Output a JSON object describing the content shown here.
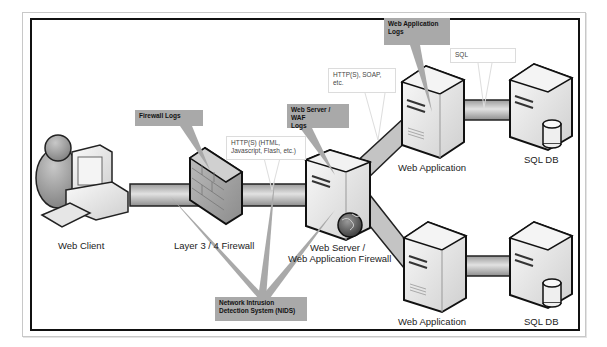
{
  "diagram": {
    "colors": {
      "frame": "#111111",
      "pipe": "#b5b5b5",
      "callout_dark": "#a9a9a9",
      "callout_light": "#ffffff"
    },
    "nodes": {
      "web_client": {
        "label": "Web Client",
        "icon": "user-computer-icon"
      },
      "firewall": {
        "label": "Layer 3 / 4 Firewall",
        "icon": "brick-firewall-icon"
      },
      "web_server": {
        "label_line1": "Web Server /",
        "label_line2": "Web Application Firewall",
        "icon": "server-globe-icon"
      },
      "web_app_top": {
        "label": "Web Application",
        "icon": "server-icon"
      },
      "web_app_bottom": {
        "label": "Web Application",
        "icon": "server-icon"
      },
      "sql_db_top": {
        "label": "SQL DB",
        "icon": "database-server-icon"
      },
      "sql_db_bottom": {
        "label": "SQL DB",
        "icon": "database-server-icon"
      }
    },
    "callouts": {
      "firewall_logs": "Firewall Logs",
      "web_server_waf_logs_line1": "Web Server / WAF",
      "web_server_waf_logs_line2": "Logs",
      "web_app_logs_line1": "Web Application",
      "web_app_logs_line2": "Logs",
      "nids_line1": "Network Intrusion",
      "nids_line2": "Detection System (NIDS)",
      "http_html_line1": "HTTP(S) (HTML,",
      "http_html_line2": "Javascript, Flash, etc.)",
      "http_soap_line1": "HTTP(S), SOAP,",
      "http_soap_line2": "etc.",
      "sql": "SQL"
    }
  }
}
